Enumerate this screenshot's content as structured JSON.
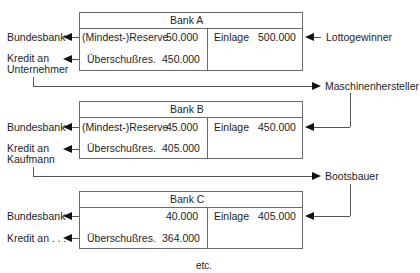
{
  "banks": [
    {
      "title": "Bank A",
      "reserve_label": "(Mindest-)Reserve",
      "reserve_value": "50.000",
      "excess_label": "Überschußres.",
      "excess_value": "450.000",
      "deposit_label": "Einlage",
      "deposit_value": "500.000",
      "left_top": "Bundesbank",
      "left_bottom_1": "Kredit an",
      "left_bottom_2": "Unternehmer",
      "right_source": "Lottogewinner"
    },
    {
      "title": "Bank B",
      "reserve_label": "(Mindest-)Reserve",
      "reserve_value": "45.000",
      "excess_label": "Überschußres.",
      "excess_value": "405.000",
      "deposit_label": "Einlage",
      "deposit_value": "450.000",
      "left_top": "Bundesbank",
      "left_bottom_1": "Kredit an",
      "left_bottom_2": "Kaufmann",
      "right_source": "Maschinenhersteller"
    },
    {
      "title": "Bank C",
      "reserve_label": "",
      "reserve_value": "40.000",
      "excess_label": "Überschußres.",
      "excess_value": "364.000",
      "deposit_label": "Einlage",
      "deposit_value": "405.000",
      "left_top": "Bundesbank",
      "left_bottom_1": "Kredit an . . .",
      "left_bottom_2": "",
      "right_source": "Bootsbauer"
    }
  ],
  "footer": "etc."
}
